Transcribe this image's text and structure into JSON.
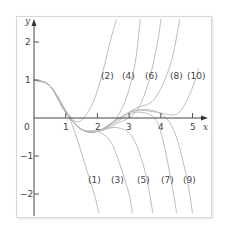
{
  "chart_data": {
    "type": "line",
    "title": "",
    "xlabel": "x",
    "ylabel": "y",
    "xlim": [
      0,
      5.5
    ],
    "ylim": [
      -2.5,
      2.5
    ],
    "x_ticks": [
      "0",
      "1",
      "2",
      "3",
      "4",
      "5"
    ],
    "y_ticks": [
      "2",
      "1",
      "-1",
      "-2"
    ],
    "grid": false,
    "legend": "none",
    "annotations": [
      "(1)",
      "(2)",
      "(3)",
      "(4)",
      "(5)",
      "(6)",
      "(7)",
      "(8)",
      "(9)",
      "(10)"
    ],
    "series": [
      {
        "name": "(1)",
        "points": [
          [
            0,
            1
          ],
          [
            0.5,
            0.85
          ],
          [
            1,
            0.2
          ],
          [
            1.3,
            -0.4
          ],
          [
            1.6,
            -1.2
          ],
          [
            1.9,
            -2.0
          ],
          [
            2.05,
            -2.5
          ]
        ]
      },
      {
        "name": "(2)",
        "points": [
          [
            0,
            1
          ],
          [
            0.5,
            0.85
          ],
          [
            1,
            0.2
          ],
          [
            1.4,
            -0.1
          ],
          [
            1.8,
            0.3
          ],
          [
            2.1,
            1.0
          ],
          [
            2.4,
            2.0
          ],
          [
            2.6,
            2.6
          ]
        ]
      },
      {
        "name": "(3)",
        "points": [
          [
            0,
            1
          ],
          [
            0.5,
            0.85
          ],
          [
            1,
            0.15
          ],
          [
            1.5,
            -0.3
          ],
          [
            2,
            -0.35
          ],
          [
            2.4,
            -0.6
          ],
          [
            2.7,
            -1.2
          ],
          [
            3.0,
            -2.0
          ],
          [
            3.1,
            -2.5
          ]
        ]
      },
      {
        "name": "(4)",
        "points": [
          [
            0,
            1
          ],
          [
            0.5,
            0.85
          ],
          [
            1,
            0.15
          ],
          [
            1.5,
            -0.3
          ],
          [
            2,
            -0.35
          ],
          [
            2.5,
            -0.1
          ],
          [
            2.9,
            0.5
          ],
          [
            3.2,
            1.5
          ],
          [
            3.35,
            2.6
          ]
        ]
      },
      {
        "name": "(5)",
        "points": [
          [
            0,
            1
          ],
          [
            0.5,
            0.85
          ],
          [
            1,
            0.15
          ],
          [
            1.5,
            -0.3
          ],
          [
            2,
            -0.35
          ],
          [
            2.6,
            -0.25
          ],
          [
            3.1,
            -0.5
          ],
          [
            3.5,
            -1.4
          ],
          [
            3.75,
            -2.5
          ]
        ]
      },
      {
        "name": "(6)",
        "points": [
          [
            0,
            1
          ],
          [
            0.5,
            0.85
          ],
          [
            1,
            0.15
          ],
          [
            1.5,
            -0.3
          ],
          [
            2,
            -0.35
          ],
          [
            2.6,
            -0.15
          ],
          [
            3.2,
            0.15
          ],
          [
            3.6,
            0.9
          ],
          [
            3.9,
            2.0
          ],
          [
            4.0,
            2.6
          ]
        ]
      },
      {
        "name": "(7)",
        "points": [
          [
            0,
            1
          ],
          [
            0.5,
            0.85
          ],
          [
            1,
            0.15
          ],
          [
            1.5,
            -0.3
          ],
          [
            2,
            -0.35
          ],
          [
            2.6,
            -0.1
          ],
          [
            3.2,
            0.15
          ],
          [
            3.8,
            0.0
          ],
          [
            4.1,
            -0.7
          ],
          [
            4.4,
            -2.0
          ],
          [
            4.5,
            -2.5
          ]
        ]
      },
      {
        "name": "(8)",
        "points": [
          [
            0,
            1
          ],
          [
            0.5,
            0.85
          ],
          [
            1,
            0.15
          ],
          [
            1.5,
            -0.3
          ],
          [
            2,
            -0.35
          ],
          [
            2.6,
            -0.05
          ],
          [
            3.2,
            0.25
          ],
          [
            3.8,
            0.5
          ],
          [
            4.3,
            1.4
          ],
          [
            4.6,
            2.6
          ]
        ]
      },
      {
        "name": "(9)",
        "points": [
          [
            0,
            1
          ],
          [
            0.5,
            0.85
          ],
          [
            1,
            0.15
          ],
          [
            1.5,
            -0.3
          ],
          [
            2,
            -0.35
          ],
          [
            2.6,
            -0.05
          ],
          [
            3.2,
            0.2
          ],
          [
            3.9,
            0.15
          ],
          [
            4.4,
            -0.3
          ],
          [
            4.8,
            -1.5
          ],
          [
            5.0,
            -2.5
          ]
        ]
      },
      {
        "name": "(10)",
        "points": [
          [
            0,
            1
          ],
          [
            0.5,
            0.85
          ],
          [
            1,
            0.15
          ],
          [
            1.5,
            -0.3
          ],
          [
            2,
            -0.35
          ],
          [
            2.6,
            -0.05
          ],
          [
            3.2,
            0.2
          ],
          [
            3.9,
            0.15
          ],
          [
            4.5,
            0.1
          ],
          [
            4.9,
            0.6
          ],
          [
            5.2,
            1.3
          ]
        ]
      }
    ]
  },
  "labels": {
    "x_axis": "x",
    "y_axis": "y",
    "origin": "0",
    "x1": "1",
    "x2": "2",
    "x3": "3",
    "x4": "4",
    "x5": "5",
    "y2": "2",
    "y1": "1",
    "ym1": "−1",
    "ym2": "−2",
    "c1": "(1)",
    "c2": "(2)",
    "c3": "(3)",
    "c4": "(4)",
    "c5": "(5)",
    "c6": "(6)",
    "c7": "(7)",
    "c8": "(8)",
    "c9": "(9)",
    "c10": "(10)"
  }
}
